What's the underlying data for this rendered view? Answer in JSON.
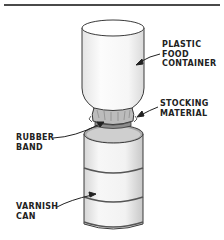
{
  "figure": {
    "type": "illustration",
    "labels": {
      "container": {
        "lines": [
          "PLASTIC",
          "FOOD",
          "CONTAINER"
        ]
      },
      "stocking": {
        "lines": [
          "STOCKING",
          "MATERIAL"
        ]
      },
      "rubber_band": {
        "lines": [
          "RUBBER",
          "BAND"
        ]
      },
      "can": {
        "lines": [
          "VARNISH",
          "CAN"
        ]
      }
    },
    "colors": {
      "line": "#3a3a3a",
      "shade": "#bdbdbd",
      "background": "#ffffff"
    }
  }
}
